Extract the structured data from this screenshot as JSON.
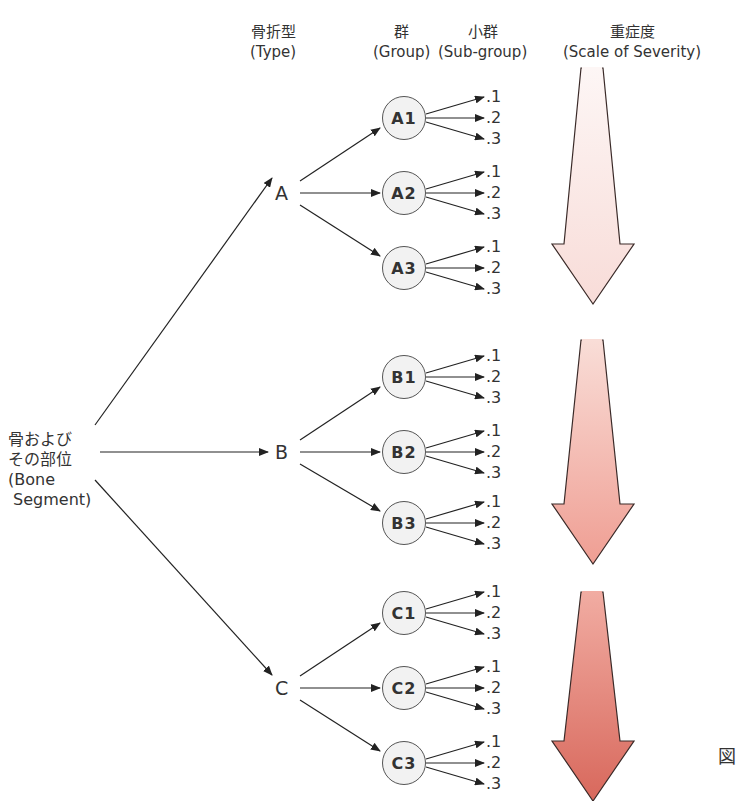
{
  "headers": {
    "type": {
      "ja": "骨折型",
      "en": "(Type)"
    },
    "group": {
      "ja": "群",
      "en": "(Group)"
    },
    "subgroup": {
      "ja": "小群",
      "en": "(Sub-group)"
    },
    "severity": {
      "ja": "重症度",
      "en": "(Scale of Severity)"
    }
  },
  "root": {
    "line1": "骨および",
    "line2": "その部位",
    "line3": "(Bone",
    "line4": " Segment)"
  },
  "types": [
    {
      "label": "A",
      "groups": [
        "A1",
        "A2",
        "A3"
      ]
    },
    {
      "label": "B",
      "groups": [
        "B1",
        "B2",
        "B3"
      ]
    },
    {
      "label": "C",
      "groups": [
        "C1",
        "C2",
        "C3"
      ]
    }
  ],
  "subgroups": [
    ".1",
    ".2",
    ".3"
  ],
  "severity_arrows": [
    {
      "for_type": "A",
      "color_top": "#fdf6f5",
      "color_bottom": "#f8dcd8"
    },
    {
      "for_type": "B",
      "color_top": "#f9ddd7",
      "color_bottom": "#ef9e93"
    },
    {
      "for_type": "C",
      "color_top": "#f1aca2",
      "color_bottom": "#d8685c"
    }
  ],
  "edge_text": "図"
}
